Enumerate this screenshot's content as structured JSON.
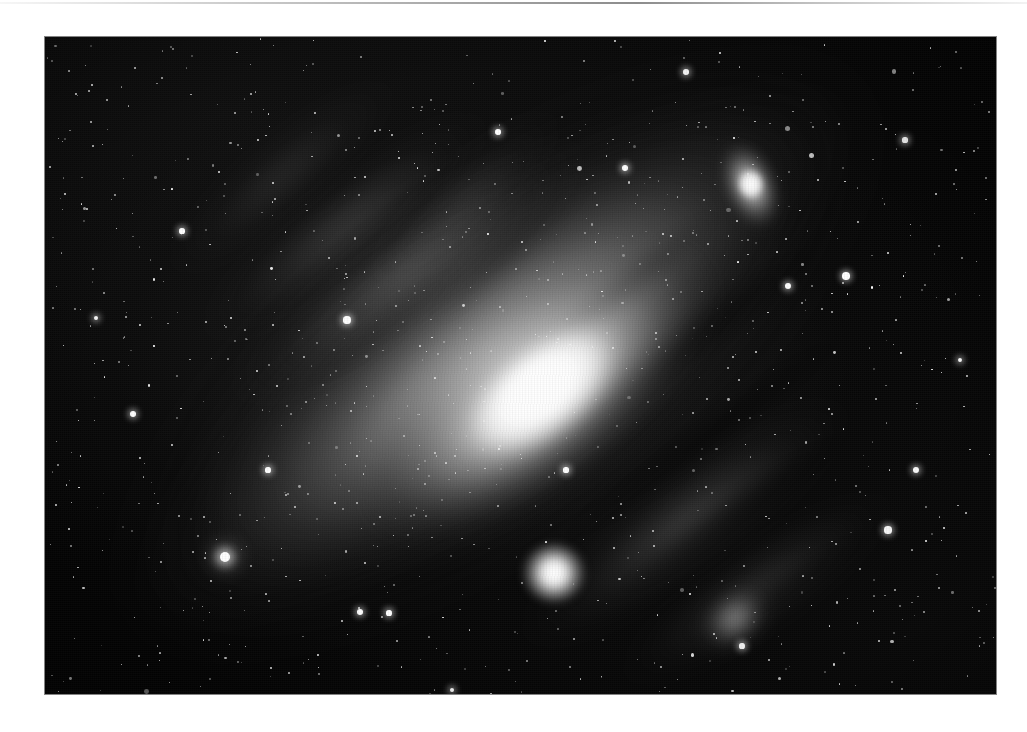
{
  "page": {
    "background_color": "#ffffff",
    "top_rule_color": "#9a9a9a"
  },
  "plate": {
    "name": "andromeda-galaxy-photographic-plate",
    "caption": "",
    "background_color": "#030303",
    "x": 45,
    "y": 37,
    "width": 951,
    "height": 657,
    "rendering": "monochrome astrophotograph"
  },
  "objects": {
    "primary": {
      "label": "M31 Andromeda Galaxy",
      "core_x": 495,
      "core_y": 355,
      "major_axis_angle_deg": -36,
      "core_color": "#ffffff",
      "halo_color": "#9a9a9a"
    },
    "companion_upper_right": {
      "label": "M110 NGC 205",
      "x": 706,
      "y": 150,
      "color": "#f2f2f2"
    },
    "companion_lower_center": {
      "label": "M32 NGC 221",
      "x": 509,
      "y": 536,
      "color": "#ffffff"
    },
    "star_cloud_knot": {
      "label": "NGC 206 star cloud",
      "x": 690,
      "y": 582,
      "color": "#dedede"
    }
  },
  "arms": [
    {
      "cx": 362,
      "cy": 234,
      "w": 430,
      "h": 96,
      "rot": -36,
      "a": 0.3
    },
    {
      "cx": 300,
      "cy": 190,
      "w": 360,
      "h": 78,
      "rot": -38,
      "a": 0.22
    },
    {
      "cx": 236,
      "cy": 140,
      "w": 300,
      "h": 62,
      "rot": -40,
      "a": 0.15
    },
    {
      "cx": 640,
      "cy": 486,
      "w": 400,
      "h": 92,
      "rot": -36,
      "a": 0.26
    },
    {
      "cx": 712,
      "cy": 552,
      "w": 330,
      "h": 74,
      "rot": -34,
      "a": 0.18
    },
    {
      "cx": 420,
      "cy": 160,
      "w": 260,
      "h": 54,
      "rot": -42,
      "a": 0.14
    }
  ],
  "dust_lanes": [
    {
      "cx": 612,
      "cy": 330,
      "w": 470,
      "h": 46,
      "rot": -37,
      "a": 0.72
    },
    {
      "cx": 660,
      "cy": 400,
      "w": 430,
      "h": 38,
      "rot": -36,
      "a": 0.62
    },
    {
      "cx": 700,
      "cy": 470,
      "w": 360,
      "h": 34,
      "rot": -35,
      "a": 0.55
    },
    {
      "cx": 560,
      "cy": 268,
      "w": 330,
      "h": 30,
      "rot": -39,
      "a": 0.45
    },
    {
      "cx": 760,
      "cy": 540,
      "w": 260,
      "h": 28,
      "rot": -34,
      "a": 0.4
    },
    {
      "cx": 470,
      "cy": 208,
      "w": 250,
      "h": 24,
      "rot": -41,
      "a": 0.3
    },
    {
      "cx": 330,
      "cy": 300,
      "w": 260,
      "h": 22,
      "rot": -38,
      "a": 0.22
    }
  ],
  "bright_stars": [
    {
      "x": 225,
      "y": 557,
      "r": 5.0,
      "cls": "big"
    },
    {
      "x": 347,
      "y": 320,
      "r": 3.6,
      "cls": "glow"
    },
    {
      "x": 846,
      "y": 276,
      "r": 3.8,
      "cls": "glow"
    },
    {
      "x": 888,
      "y": 530,
      "r": 3.6,
      "cls": "glow"
    },
    {
      "x": 133,
      "y": 414,
      "r": 3.2,
      "cls": "glow"
    },
    {
      "x": 625,
      "y": 168,
      "r": 3.0,
      "cls": "glow"
    },
    {
      "x": 916,
      "y": 470,
      "r": 3.2,
      "cls": "glow"
    },
    {
      "x": 788,
      "y": 286,
      "r": 3.0,
      "cls": "glow"
    },
    {
      "x": 498,
      "y": 132,
      "r": 2.8,
      "cls": "glow"
    },
    {
      "x": 360,
      "y": 612,
      "r": 3.0,
      "cls": "glow"
    },
    {
      "x": 389,
      "y": 613,
      "r": 2.6,
      "cls": "glow"
    },
    {
      "x": 686,
      "y": 72,
      "r": 2.8,
      "cls": "glow"
    },
    {
      "x": 182,
      "y": 231,
      "r": 2.6,
      "cls": "glow"
    },
    {
      "x": 905,
      "y": 140,
      "r": 2.6,
      "cls": "glow"
    },
    {
      "x": 268,
      "y": 470,
      "r": 2.6,
      "cls": "glow"
    },
    {
      "x": 566,
      "y": 470,
      "r": 2.6,
      "cls": "glow"
    },
    {
      "x": 742,
      "y": 646,
      "r": 2.6,
      "cls": "glow"
    },
    {
      "x": 96,
      "y": 318,
      "r": 2.4,
      "cls": "glow"
    },
    {
      "x": 960,
      "y": 360,
      "r": 2.4,
      "cls": "glow"
    },
    {
      "x": 452,
      "y": 690,
      "r": 2.4,
      "cls": "glow"
    }
  ],
  "star_field": {
    "count": 1500,
    "color": "#ffffff",
    "min_radius": 0.5,
    "max_radius": 2.6
  }
}
